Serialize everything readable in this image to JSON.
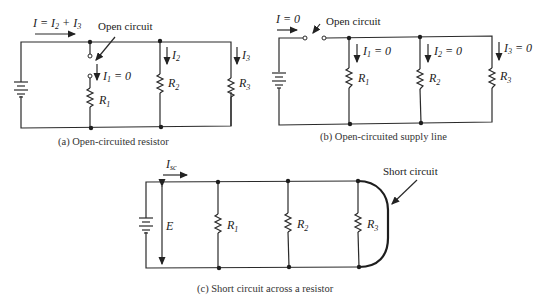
{
  "diagram_a": {
    "current_label": "I = I",
    "current_sub1": "2",
    "current_plus": " + I",
    "current_sub2": "3",
    "annotation": "Open circuit",
    "i1_label": "I",
    "i1_sub": "1",
    "i1_value": " = 0",
    "i2_label": "I",
    "i2_sub": "2",
    "i3_label": "I",
    "i3_sub": "3",
    "r1_label": "R",
    "r1_sub": "1",
    "r2_label": "R",
    "r2_sub": "2",
    "r3_label": "R",
    "r3_sub": "3",
    "caption": "(a) Open-circuited resistor"
  },
  "diagram_b": {
    "current_label": "I = 0",
    "annotation": "Open circuit",
    "i1_label": "I",
    "i1_sub": "1",
    "i1_value": " = 0",
    "i2_label": "I",
    "i2_sub": "2",
    "i2_value": " = 0",
    "i3_label": "I",
    "i3_sub": "3",
    "i3_value": " = 0",
    "r1_label": "R",
    "r1_sub": "1",
    "r2_label": "R",
    "r2_sub": "2",
    "r3_label": "R",
    "r3_sub": "3",
    "caption": "(b) Open-circuited supply line"
  },
  "diagram_c": {
    "current_label": "I",
    "current_sub": "sc",
    "voltage_label": "E",
    "annotation": "Short circuit",
    "r1_label": "R",
    "r1_sub": "1",
    "r2_label": "R",
    "r2_sub": "2",
    "r3_label": "R",
    "r3_sub": "3",
    "caption": "(c) Short circuit across a resistor"
  }
}
